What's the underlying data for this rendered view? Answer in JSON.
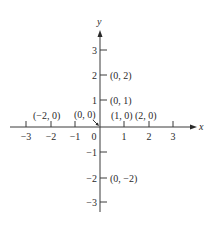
{
  "diagram": {
    "type": "coordinate-plane",
    "axes": {
      "x_label": "x",
      "y_label": "y",
      "x_ticks": [
        {
          "value": -3,
          "label": "−3"
        },
        {
          "value": -2,
          "label": "−2"
        },
        {
          "value": -1,
          "label": "−1"
        },
        {
          "value": 0,
          "label": "0"
        },
        {
          "value": 1,
          "label": "1"
        },
        {
          "value": 2,
          "label": "2"
        },
        {
          "value": 3,
          "label": "3"
        }
      ],
      "y_ticks": [
        {
          "value": 3,
          "label": "3"
        },
        {
          "value": 2,
          "label": "2"
        },
        {
          "value": 1,
          "label": "1"
        },
        {
          "value": -1,
          "label": "−1"
        },
        {
          "value": -2,
          "label": "−2"
        },
        {
          "value": -3,
          "label": "−3"
        }
      ]
    },
    "points": [
      {
        "label": "(0, 2)"
      },
      {
        "label": "(0, 1)"
      },
      {
        "label": "(−2, 0)"
      },
      {
        "label": "(0, 0)"
      },
      {
        "label": "(1, 0)"
      },
      {
        "label": "(2, 0)"
      },
      {
        "label": "(0, −2)"
      }
    ]
  }
}
